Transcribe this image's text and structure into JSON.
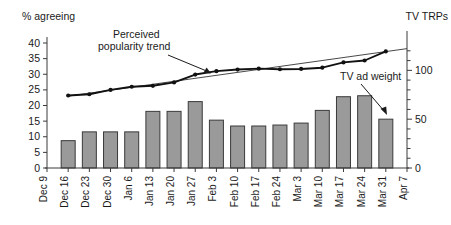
{
  "chart_data": {
    "type": "bar",
    "title": "",
    "subtitle": "",
    "categories": [
      "Dec 9",
      "Dec 16",
      "Dec 23",
      "Dec 30",
      "Jan 6",
      "Jan 13",
      "Jan 20",
      "Jan 27",
      "Feb 3",
      "Feb 10",
      "Feb 17",
      "Feb 24",
      "Mar 3",
      "Mar 10",
      "Mar 17",
      "Mar 24",
      "Mar 31",
      "Apr 7"
    ],
    "xlabel": "",
    "ylabel": "% agreeing",
    "y2label": "TV TRPs",
    "ylim": [
      0,
      40
    ],
    "y2lim": [
      0,
      128
    ],
    "yticks": [
      0,
      5,
      10,
      15,
      20,
      25,
      30,
      35,
      40
    ],
    "y2ticks": [
      0,
      50,
      100
    ],
    "y2minorticks": [
      10,
      20,
      30,
      40,
      60,
      70,
      80,
      90,
      110,
      120
    ],
    "grid": false,
    "legend_position": "none",
    "series": [
      {
        "name": "TV ad weight",
        "type": "bar",
        "axis": "right",
        "unit": "TRPs",
        "values": [
          null,
          28,
          37,
          37,
          37,
          58,
          58,
          68,
          49,
          43,
          43,
          44,
          46,
          59,
          73,
          74,
          50,
          null
        ]
      },
      {
        "name": "% agreeing",
        "type": "line",
        "axis": "left",
        "unit": "%",
        "values": [
          null,
          23.2,
          23.6,
          25.0,
          26.0,
          26.3,
          27.4,
          29.9,
          31.0,
          31.5,
          31.8,
          31.6,
          31.7,
          32.1,
          33.8,
          34.4,
          37.3,
          null
        ]
      },
      {
        "name": "Perceived popularity trend",
        "type": "line-fit",
        "axis": "left",
        "unit": "%",
        "endpoints": [
          {
            "x_index": 1,
            "value": 23.0
          },
          {
            "x_index": 17,
            "value": 38.2
          }
        ]
      }
    ],
    "annotations": [
      {
        "name": "perceived-popularity-trend",
        "text_lines": [
          "Perceived",
          "popularity trend"
        ],
        "points_to": "trend line near Feb 3"
      },
      {
        "name": "tv-ad-weight",
        "text_lines": [
          "TV ad weight"
        ],
        "points_to": "last bar Mar 31"
      }
    ]
  },
  "axes": {
    "left_title": "% agreeing",
    "right_title": "TV TRPs"
  }
}
